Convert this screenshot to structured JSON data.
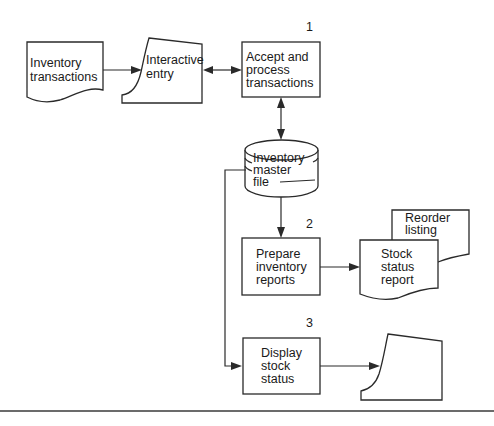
{
  "diagram": {
    "type": "system flowchart",
    "nodes": {
      "inventory_transactions": {
        "shape": "document",
        "lines": [
          "Inventory",
          "transactions"
        ]
      },
      "interactive_entry": {
        "shape": "online-input",
        "lines": [
          "Interactive",
          "entry"
        ]
      },
      "process_1": {
        "shape": "process",
        "number": "1",
        "lines": [
          "Accept and",
          "process",
          "transactions"
        ]
      },
      "inventory_master_file": {
        "shape": "disk-storage",
        "lines": [
          "Inventory",
          "master",
          "file"
        ]
      },
      "process_2": {
        "shape": "process",
        "number": "2",
        "lines": [
          "Prepare",
          "inventory",
          "reports"
        ]
      },
      "reorder_listing": {
        "shape": "document",
        "lines": [
          "Reorder",
          "listing"
        ]
      },
      "stock_status_report": {
        "shape": "document",
        "lines": [
          "Stock",
          "status",
          "report"
        ]
      },
      "process_3": {
        "shape": "process",
        "number": "3",
        "lines": [
          "Display",
          "stock",
          "status"
        ]
      },
      "display_terminal": {
        "shape": "display",
        "lines": []
      }
    },
    "edges": [
      {
        "from": "inventory_transactions",
        "to": "interactive_entry",
        "direction": "one-way"
      },
      {
        "from": "interactive_entry",
        "to": "process_1",
        "direction": "two-way"
      },
      {
        "from": "process_1",
        "to": "inventory_master_file",
        "direction": "two-way"
      },
      {
        "from": "inventory_master_file",
        "to": "process_2",
        "direction": "one-way"
      },
      {
        "from": "process_2",
        "to": "stock_status_report",
        "direction": "one-way"
      },
      {
        "from": "inventory_master_file",
        "to": "process_3",
        "direction": "one-way"
      },
      {
        "from": "process_3",
        "to": "display_terminal",
        "direction": "one-way"
      }
    ],
    "colors": {
      "stroke": "#2a2a2a",
      "text": "#1a1a1a",
      "background": "#ffffff"
    }
  }
}
